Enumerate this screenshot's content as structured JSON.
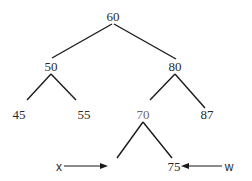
{
  "diagram": {
    "type": "binary-search-tree",
    "nodes": {
      "root": "60",
      "left": "50",
      "right": "80",
      "left_left": "45",
      "left_right": "55",
      "right_left": "70",
      "right_right": "87",
      "right_left_left": "",
      "right_left_right": "75"
    },
    "pointers": {
      "x": {
        "label": "x",
        "target": "empty left child of 70"
      },
      "w": {
        "label": "w",
        "target": "75"
      }
    }
  }
}
